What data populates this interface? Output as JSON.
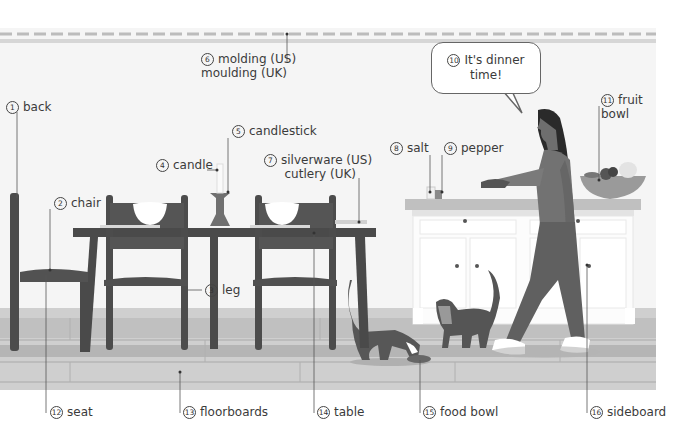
{
  "labels": [
    {
      "id": "1",
      "num": "1",
      "text": "back"
    },
    {
      "id": "2",
      "num": "2",
      "text": "chair"
    },
    {
      "id": "3",
      "num": "3",
      "text": "leg"
    },
    {
      "id": "4",
      "num": "4",
      "text": "candle"
    },
    {
      "id": "5",
      "num": "5",
      "text": "candlestick"
    },
    {
      "id": "6",
      "num": "6",
      "text": "molding (US)",
      "text2": "moulding (UK)"
    },
    {
      "id": "7",
      "num": "7",
      "text": "silverware (US)",
      "text2": "cutlery (UK)"
    },
    {
      "id": "8",
      "num": "8",
      "text": "salt"
    },
    {
      "id": "9",
      "num": "9",
      "text": "pepper"
    },
    {
      "id": "10",
      "num": "10",
      "text": "It's dinner",
      "text2": "time!"
    },
    {
      "id": "11",
      "num": "11",
      "text": "fruit",
      "text2": "bowl"
    },
    {
      "id": "12",
      "num": "12",
      "text": "seat"
    },
    {
      "id": "13",
      "num": "13",
      "text": "floorboards"
    },
    {
      "id": "14",
      "num": "14",
      "text": "table"
    },
    {
      "id": "15",
      "num": "15",
      "text": "food bowl"
    },
    {
      "id": "16",
      "num": "16",
      "text": "sideboard"
    }
  ],
  "colors": {
    "wall": "#f4f4f4",
    "molding": "#c8c8c8",
    "floor": "#c9c9c9",
    "floor_dark": "#b3b3b3",
    "furniture": "#4e4e4e",
    "sideboard": "#fafafa",
    "countertop": "#bdbdbd",
    "person": "#6e6e6e",
    "hair": "#2a2a2a",
    "cat": "#555555"
  }
}
